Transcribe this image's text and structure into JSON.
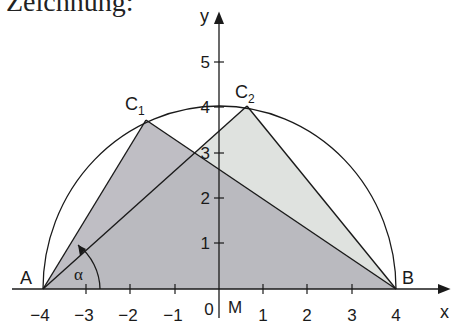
{
  "heading": "Zeichnung:",
  "axes": {
    "x_label": "x",
    "y_label": "y",
    "x_ticks": [
      "−4",
      "−3",
      "−2",
      "−1",
      "0",
      "1",
      "2",
      "3",
      "4"
    ],
    "y_ticks": [
      "1",
      "2",
      "3",
      "4",
      "5"
    ],
    "origin_label": "0",
    "center_label": "M"
  },
  "points": {
    "A": {
      "label": "A",
      "x": -4,
      "y": 0
    },
    "B": {
      "label": "B",
      "x": 4,
      "y": 0
    },
    "C1": {
      "label": "C",
      "sub": "1",
      "x": -1.6,
      "y": 3.67
    },
    "C2": {
      "label": "C",
      "sub": "2",
      "x": 0.6,
      "y": 3.95
    }
  },
  "angle_label": "α",
  "circle": {
    "center": "M",
    "radius": 4,
    "part": "upper semicircle"
  },
  "colors": {
    "fill_triangle_1": "#b9b7bd",
    "fill_triangle_2": "#dcdfdc",
    "stroke": "#1a1a1a"
  }
}
